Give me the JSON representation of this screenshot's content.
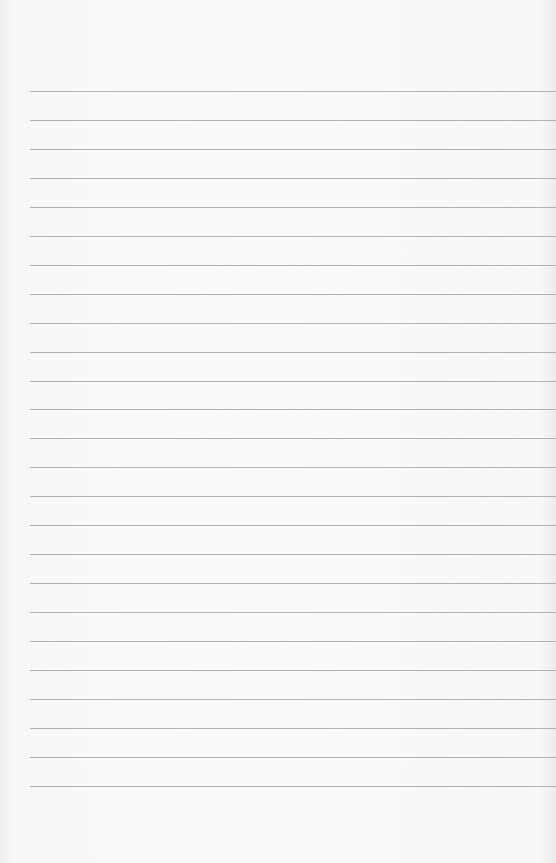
{
  "page": {
    "type": "blank lined paper",
    "line_count": 25,
    "first_line_y": 91,
    "line_spacing": 28.95,
    "line_left": 30,
    "colors": {
      "paper": "#f8f8f7",
      "rule": "#9a9a9a"
    }
  }
}
